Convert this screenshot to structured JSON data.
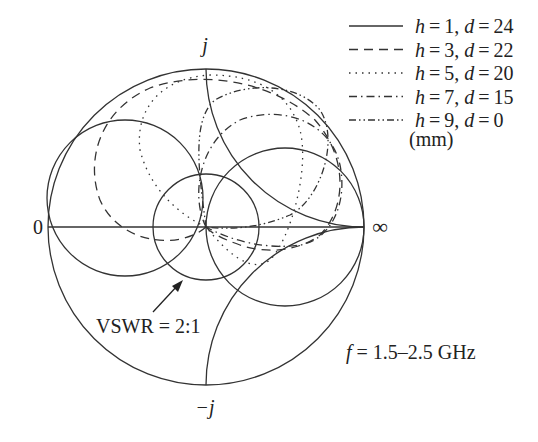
{
  "chart_data": {
    "type": "smith",
    "title": "",
    "axis_labels": {
      "top": "j",
      "bottom": "−j",
      "left": "0",
      "right": "∞"
    },
    "annotations": {
      "vswr": "VSWR = 2:1",
      "frequency_var": "f",
      "frequency_range": " = 1.5–2.5 GHz"
    },
    "legend": {
      "placement": "top-right",
      "unit": "(mm)",
      "entries": [
        {
          "label_h": "h",
          "h": "1",
          "label_d": "d",
          "d": "24",
          "style": "solid"
        },
        {
          "label_h": "h",
          "h": "3",
          "label_d": "d",
          "d": "22",
          "style": "dashed"
        },
        {
          "label_h": "h",
          "h": "5",
          "label_d": "d",
          "d": "20",
          "style": "dotted"
        },
        {
          "label_h": "h",
          "h": "7",
          "label_d": "d",
          "d": "15",
          "style": "dash-dot"
        },
        {
          "label_h": "h",
          "h": "9",
          "label_d": "d",
          "d": "0",
          "style": "dash-dot-dot"
        }
      ]
    },
    "series": [
      {
        "name": "h=1, d=24",
        "style": "solid",
        "shape": "loop upper-left, near matched point"
      },
      {
        "name": "h=3, d=22",
        "style": "dashed",
        "shape": "large loop upper region"
      },
      {
        "name": "h=5, d=20",
        "style": "dotted",
        "shape": "loop upper region"
      },
      {
        "name": "h=7, d=15",
        "style": "dash-dot",
        "shape": "loop upper right region"
      },
      {
        "name": "h=9, d=0",
        "style": "dash-dot-dot",
        "shape": "loop upper region"
      }
    ],
    "grid_circles": [
      "unit circle",
      "r=1",
      "g=1 (VSWR reference)",
      "x=+1",
      "x=-1",
      "VSWR=2 circle"
    ]
  }
}
